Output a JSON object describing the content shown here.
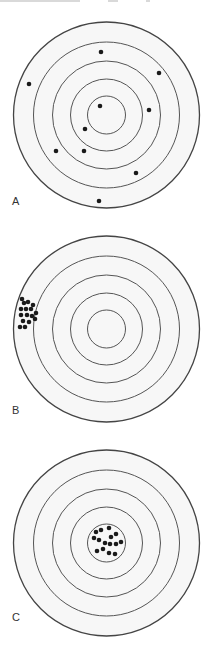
{
  "figure": {
    "colors": {
      "ring": "#555555",
      "outer_ring": "#444444",
      "dot": "#1a1a1a",
      "fill": "#f7f7f7"
    },
    "ring_radii": [
      93,
      73,
      54,
      36,
      19
    ],
    "panels": [
      {
        "label": "A",
        "description": "Shots scattered widely across all rings",
        "top": 0,
        "center": [
          106.5,
          115
        ],
        "label_top": 196,
        "dots": [
          [
            101,
            52
          ],
          [
            29,
            84
          ],
          [
            159,
            73
          ],
          [
            100,
            106
          ],
          [
            149,
            110
          ],
          [
            85,
            129
          ],
          [
            56,
            151
          ],
          [
            84,
            151
          ],
          [
            136,
            173
          ],
          [
            99,
            201
          ]
        ]
      },
      {
        "label": "B",
        "description": "Shots tightly grouped near the left edge of the outer ring",
        "top": 214,
        "center": [
          106.5,
          115
        ],
        "label_top": 191,
        "dots": [
          [
            22,
            85
          ],
          [
            24,
            89
          ],
          [
            28,
            88
          ],
          [
            33,
            91
          ],
          [
            21,
            95
          ],
          [
            26,
            95
          ],
          [
            31,
            95
          ],
          [
            36,
            99
          ],
          [
            21,
            101
          ],
          [
            27,
            101
          ],
          [
            32,
            102
          ],
          [
            23,
            107
          ],
          [
            29,
            108
          ],
          [
            35,
            105
          ],
          [
            25,
            113
          ],
          [
            20,
            113
          ]
        ]
      },
      {
        "label": "C",
        "description": "Shots tightly grouped inside the bullseye",
        "top": 428,
        "center": [
          106.5,
          115
        ],
        "label_top": 184,
        "dots": [
          [
            96,
            104
          ],
          [
            101,
            102
          ],
          [
            109,
            100
          ],
          [
            116,
            106
          ],
          [
            94,
            110
          ],
          [
            99,
            112
          ],
          [
            111,
            109
          ],
          [
            105,
            115
          ],
          [
            110,
            116
          ],
          [
            116,
            116
          ],
          [
            121,
            114
          ],
          [
            97,
            123
          ],
          [
            103,
            121
          ],
          [
            109,
            125
          ],
          [
            115,
            126
          ]
        ]
      }
    ]
  }
}
